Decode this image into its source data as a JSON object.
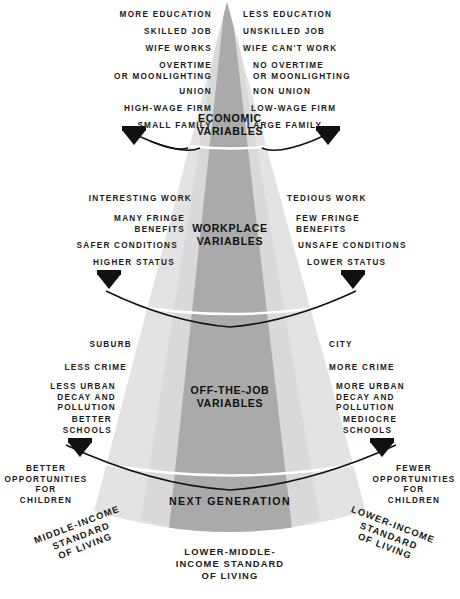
{
  "diagram": {
    "colors": {
      "center_band": "#aaaaaa",
      "side_band": "#d9d9d9",
      "outer_band": "#e3e3e3",
      "divider": "#ffffff",
      "arc": "#111111",
      "text": "#1b1b1b",
      "background": "#ffffff"
    },
    "sections": [
      {
        "id": "economic",
        "title": "ECONOMIC\nVARIABLES",
        "left_items": [
          "MORE EDUCATION",
          "SKILLED JOB",
          "WIFE WORKS",
          "OVERTIME\nOR MOONLIGHTING",
          "UNION",
          "HIGH-WAGE FIRM",
          "SMALL FAMILY"
        ],
        "right_items": [
          "LESS EDUCATION",
          "UNSKILLED JOB",
          "WIFE CAN'T WORK",
          "NO OVERTIME\nOR MOONLIGHTING",
          "NON UNION",
          "LOW-WAGE FIRM",
          "LARGE FAMILY"
        ]
      },
      {
        "id": "workplace",
        "title": "WORKPLACE\nVARIABLES",
        "left_items": [
          "INTERESTING WORK",
          "MANY FRINGE\nBENEFITS",
          "SAFER CONDITIONS",
          "HIGHER STATUS"
        ],
        "right_items": [
          "TEDIOUS WORK",
          "FEW FRINGE\nBENEFITS",
          "UNSAFE CONDITIONS",
          "LOWER STATUS"
        ]
      },
      {
        "id": "off-the-job",
        "title": "OFF-THE-JOB\nVARIABLES",
        "left_items": [
          "SUBURB",
          "LESS CRIME",
          "LESS URBAN\nDECAY AND\nPOLLUTION",
          "BETTER\nSCHOOLS"
        ],
        "right_items": [
          "CITY",
          "MORE CRIME",
          "MORE URBAN\nDECAY AND\nPOLLUTION",
          "MEDIOCRE\nSCHOOLS"
        ]
      },
      {
        "id": "next-generation",
        "title": "NEXT  GENERATION",
        "left_items": [
          "BETTER\nOPPORTUNITIES\nFOR\nCHILDREN"
        ],
        "right_items": [
          "FEWER\nOPPORTUNITIES\nFOR\nCHILDREN"
        ]
      }
    ],
    "base_labels": {
      "left": "MIDDLE-INCOME\nSTANDARD\nOF LIVING",
      "center": "LOWER-MIDDLE-\nINCOME STANDARD\nOF LIVING",
      "right": "LOWER-INCOME\nSTANDARD\nOF LIVING"
    }
  }
}
